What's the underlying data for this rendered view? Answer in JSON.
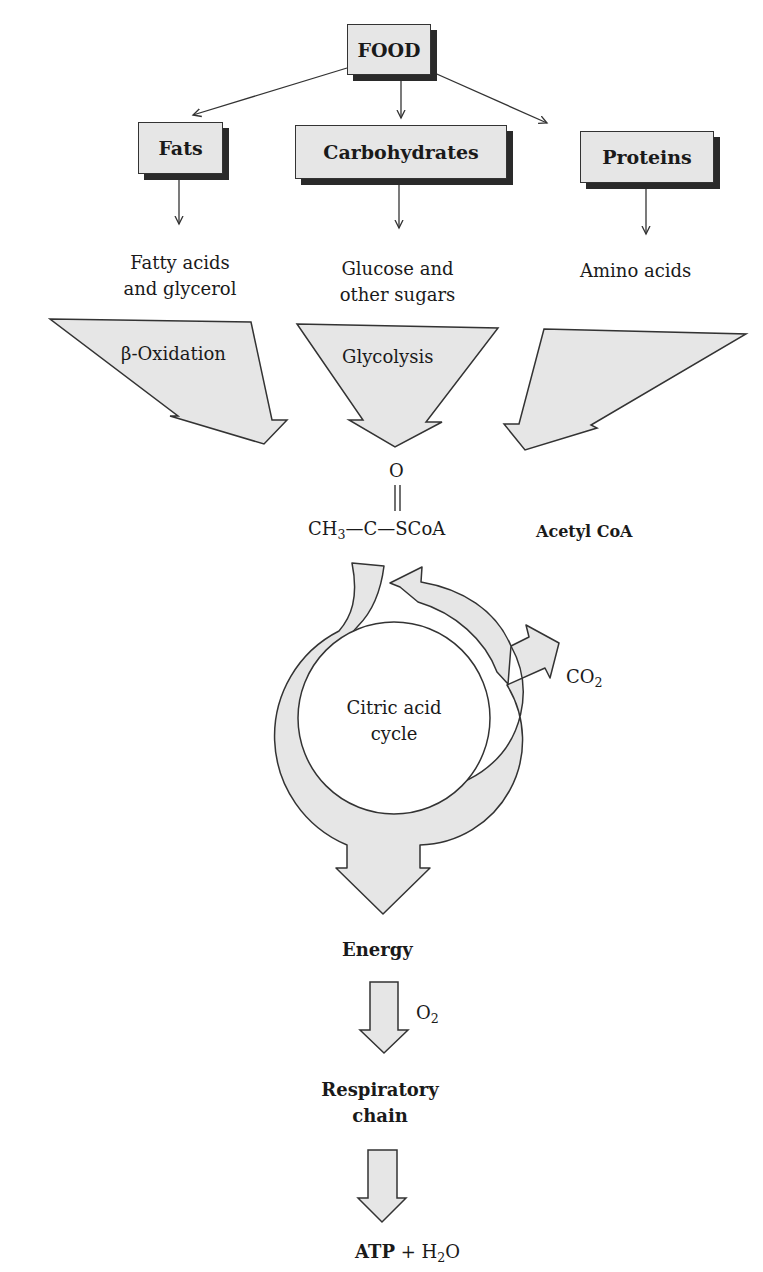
{
  "diagram": {
    "sources": {
      "food": "FOOD",
      "fats": "Fats",
      "carbohydrates": "Carbohydrates",
      "proteins": "Proteins"
    },
    "products": {
      "fats_line1": "Fatty acids",
      "fats_line2": "and glycerol",
      "carbs_line1": "Glucose and",
      "carbs_line2": "other sugars",
      "proteins": "Amino acids"
    },
    "pathways": {
      "fats": "β-Oxidation",
      "carbs": "Glycolysis",
      "proteins": ""
    },
    "acetyl_coa": {
      "o": "O",
      "ch3": "CH",
      "ch3_sub": "3",
      "bond1": "—",
      "c": "C",
      "bond2": "—",
      "scoa": "SCoA",
      "name": "Acetyl CoA"
    },
    "cycle": {
      "line1": "Citric acid",
      "line2": "cycle",
      "co2": "CO",
      "co2_sub": "2"
    },
    "energy": "Energy",
    "o2": "O",
    "o2_sub": "2",
    "respiratory_line1": "Respiratory",
    "respiratory_line2": "chain",
    "final": {
      "atp": "ATP",
      "plus": "+",
      "h": "H",
      "h_sub": "2",
      "o": "O"
    },
    "colors": {
      "fill": "#e6e6e6",
      "stroke": "#333333",
      "shadow": "#2a2a2a",
      "text": "#1a1a1a"
    }
  }
}
